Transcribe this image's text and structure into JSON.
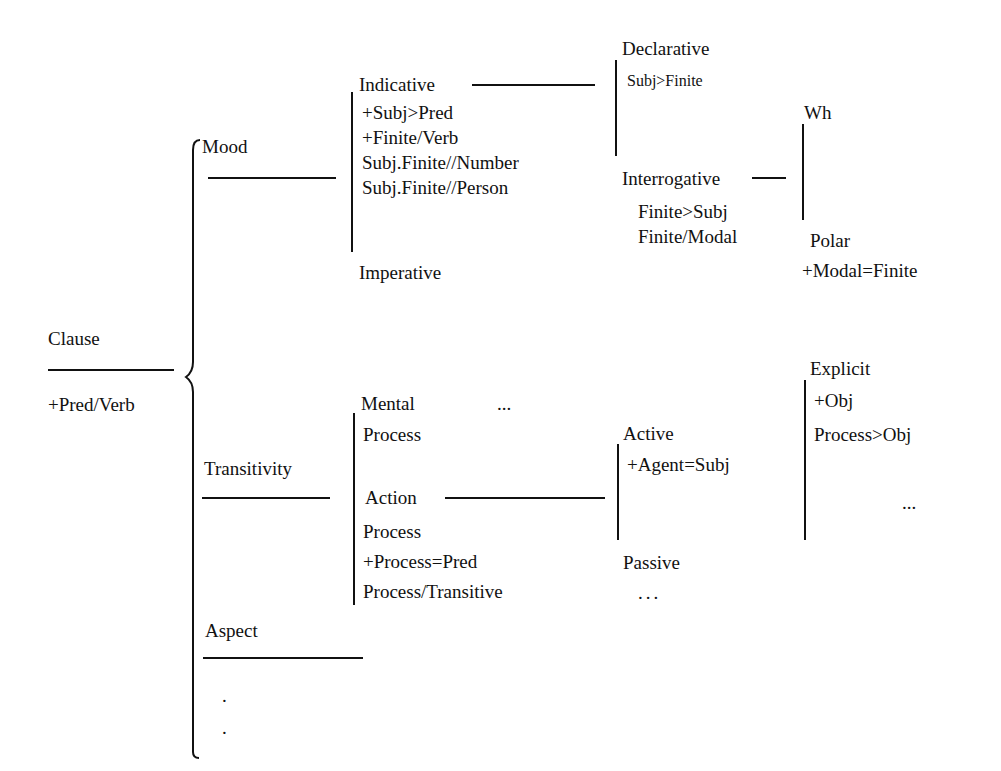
{
  "root": {
    "label": "Clause",
    "feature": "+Pred/Verb"
  },
  "systems": {
    "mood": {
      "label": "Mood",
      "options": {
        "indicative": {
          "label": "Indicative",
          "features": [
            "+Subj>Pred",
            "+Finite/Verb",
            "Subj.Finite//Number",
            "Subj.Finite//Person"
          ],
          "subsystem": {
            "declarative": {
              "label": "Declarative",
              "features": [
                "Subj>Finite"
              ]
            },
            "interrogative": {
              "label": "Interrogative",
              "features": [
                "Finite>Subj",
                "Finite/Modal"
              ],
              "subsystem": {
                "wh": {
                  "label": "Wh"
                },
                "polar": {
                  "label": "Polar",
                  "features": [
                    "+Modal=Finite"
                  ]
                }
              }
            }
          }
        },
        "imperative": {
          "label": "Imperative"
        }
      }
    },
    "transitivity": {
      "label": "Transitivity",
      "options": {
        "mental": {
          "label_lines": [
            "Mental",
            "Process"
          ],
          "ellipsis": "..."
        },
        "action": {
          "label_lines": [
            "Action",
            "Process"
          ],
          "features": [
            "+Process=Pred",
            "Process/Transitive"
          ],
          "subsystem": {
            "active": {
              "label": "Active",
              "features": [
                "+Agent=Subj"
              ],
              "subsystem": {
                "explicit": {
                  "label": "Explicit",
                  "features": [
                    "+Obj",
                    "Process>Obj"
                  ]
                },
                "more": "..."
              }
            },
            "passive": {
              "label": "Passive",
              "ellipsis": "..."
            }
          }
        }
      }
    },
    "aspect": {
      "label": "Aspect"
    },
    "continuation": ".\n."
  }
}
